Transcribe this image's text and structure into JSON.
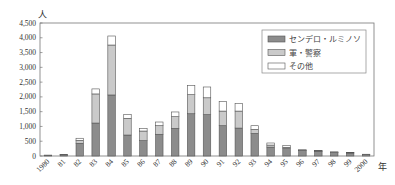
{
  "chart_data": {
    "type": "bar",
    "stacked": true,
    "title": "",
    "xlabel": "年",
    "ylabel": "人",
    "ylim": [
      0,
      4500
    ],
    "yticks": [
      0,
      500,
      1000,
      1500,
      2000,
      2500,
      3000,
      3500,
      4000,
      4500
    ],
    "ytick_labels": [
      "0",
      "500",
      "1,000",
      "1,500",
      "2,000",
      "2,500",
      "3,000",
      "3,500",
      "4,000",
      "4,500"
    ],
    "categories": [
      "1980",
      "81",
      "82",
      "83",
      "84",
      "85",
      "86",
      "87",
      "88",
      "89",
      "90",
      "91",
      "92",
      "93",
      "94",
      "95",
      "96",
      "97",
      "98",
      "99",
      "2000"
    ],
    "series": [
      {
        "name": "センデロ・ルミノソ",
        "color": "#8c8c8c",
        "values": [
          20,
          40,
          430,
          1115,
          2065,
          710,
          520,
          735,
          935,
          1430,
          1400,
          1025,
          945,
          765,
          300,
          250,
          190,
          160,
          120,
          100,
          50
        ]
      },
      {
        "name": "軍・警察",
        "color": "#cacaca",
        "values": [
          5,
          5,
          100,
          985,
          1690,
          565,
          325,
          290,
          395,
          645,
          570,
          495,
          575,
          135,
          70,
          45,
          10,
          10,
          10,
          10,
          5
        ]
      },
      {
        "name": "その他",
        "color": "#ffffff",
        "values": [
          5,
          5,
          70,
          170,
          305,
          135,
          90,
          125,
          160,
          315,
          365,
          320,
          260,
          125,
          70,
          55,
          10,
          10,
          10,
          10,
          5
        ]
      }
    ],
    "grid": false,
    "legend_position": "upper right"
  }
}
